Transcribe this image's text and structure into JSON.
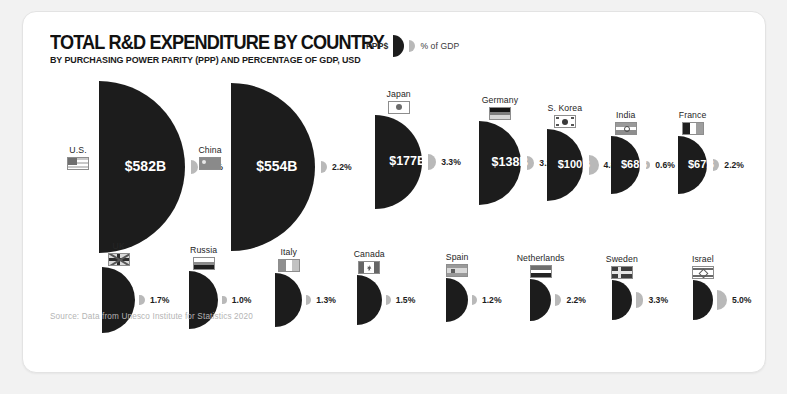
{
  "header": {
    "title": "TOTAL R&D EXPENDITURE BY COUNTRY",
    "subtitle": "BY PURCHASING POWER PARITY (PPP) AND PERCENTAGE OF GDP, USD"
  },
  "legend": {
    "left_label": "PPP$",
    "right_label": "% of GDP"
  },
  "source": "Source: Data from Unesco Institute for Statistics 2020",
  "colors": {
    "expenditure": "#1c1c1c",
    "gdp": "#b9b9b9",
    "card": "#ffffff",
    "background": "#f2f2f2",
    "source_text": "#b4b4b4"
  },
  "chart_data": {
    "type": "bar",
    "title": "TOTAL R&D EXPENDITURE BY COUNTRY",
    "subtitle": "BY PURCHASING POWER PARITY (PPP) AND PERCENTAGE OF GDP, USD",
    "xlabel": "",
    "ylabel": "",
    "categories": [
      "U.S.",
      "China",
      "Japan",
      "Germany",
      "S. Korea",
      "India",
      "France",
      "UK",
      "Russia",
      "Italy",
      "Canada",
      "Spain",
      "Netherlands",
      "Sweden",
      "Israel"
    ],
    "series": [
      {
        "name": "PPP$",
        "unit": "billion USD",
        "values": [
          582,
          554,
          177,
          138,
          100,
          68,
          67,
          52,
          40,
          35,
          28,
          23,
          21,
          18,
          18
        ]
      },
      {
        "name": "% of GDP",
        "unit": "percent",
        "values": [
          2.9,
          2.2,
          3.3,
          3.1,
          4.8,
          0.6,
          2.2,
          1.7,
          1.0,
          1.3,
          1.5,
          1.2,
          2.2,
          3.3,
          5.0
        ]
      }
    ],
    "rows": [
      {
        "name": "U.S.",
        "value_label": "$582B",
        "value": 582,
        "pct_label": "2.9%",
        "pct": 2.9,
        "flag": "flag-us",
        "row": 1
      },
      {
        "name": "China",
        "value_label": "$554B",
        "value": 554,
        "pct_label": "2.2%",
        "pct": 2.2,
        "flag": "flag-cn",
        "row": 1
      },
      {
        "name": "Japan",
        "value_label": "$177B",
        "value": 177,
        "pct_label": "3.3%",
        "pct": 3.3,
        "flag": "flag-jp",
        "row": 1
      },
      {
        "name": "Germany",
        "value_label": "$138B",
        "value": 138,
        "pct_label": "3.1%",
        "pct": 3.1,
        "flag": "flag-de",
        "row": 1
      },
      {
        "name": "S. Korea",
        "value_label": "$100B",
        "value": 100,
        "pct_label": "4.8%",
        "pct": 4.8,
        "flag": "flag-kr",
        "row": 1
      },
      {
        "name": "India",
        "value_label": "$68B",
        "value": 68,
        "pct_label": "0.6%",
        "pct": 0.6,
        "flag": "flag-in",
        "row": 1
      },
      {
        "name": "France",
        "value_label": "$67B",
        "value": 67,
        "pct_label": "2.2%",
        "pct": 2.2,
        "flag": "flag-fr",
        "row": 1
      },
      {
        "name": "UK",
        "value_label": "$52B",
        "value": 52,
        "pct_label": "1.7%",
        "pct": 1.7,
        "flag": "flag-uk",
        "row": 2
      },
      {
        "name": "Russia",
        "value_label": "$40B",
        "value": 40,
        "pct_label": "1.0%",
        "pct": 1.0,
        "flag": "flag-ru",
        "row": 2
      },
      {
        "name": "Italy",
        "value_label": "$35B",
        "value": 35,
        "pct_label": "1.3%",
        "pct": 1.3,
        "flag": "flag-it",
        "row": 2
      },
      {
        "name": "Canada",
        "value_label": "$28B",
        "value": 28,
        "pct_label": "1.5%",
        "pct": 1.5,
        "flag": "flag-ca",
        "row": 2
      },
      {
        "name": "Spain",
        "value_label": "$23B",
        "value": 23,
        "pct_label": "1.2%",
        "pct": 1.2,
        "flag": "flag-es",
        "row": 2
      },
      {
        "name": "Netherlands",
        "value_label": "$21B",
        "value": 21,
        "pct_label": "2.2%",
        "pct": 2.2,
        "flag": "flag-nl",
        "row": 2
      },
      {
        "name": "Sweden",
        "value_label": "$18B",
        "value": 18,
        "pct_label": "3.3%",
        "pct": 3.3,
        "flag": "flag-se",
        "row": 2
      },
      {
        "name": "Israel",
        "value_label": "$18B",
        "value": 18,
        "pct_label": "5.0%",
        "pct": 5.0,
        "flag": "flag-il",
        "row": 2
      }
    ]
  }
}
